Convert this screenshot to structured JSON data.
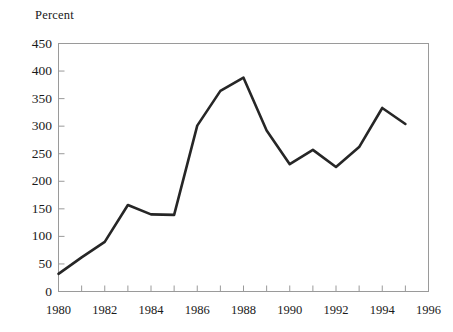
{
  "chart_data": {
    "type": "line",
    "title": "",
    "subtitle": "",
    "ylabel": "Percent",
    "xlabel": "",
    "x": [
      1980,
      1981,
      1982,
      1983,
      1984,
      1985,
      1986,
      1987,
      1988,
      1989,
      1990,
      1991,
      1992,
      1993,
      1994,
      1995
    ],
    "values": [
      32,
      62,
      90,
      157,
      140,
      139,
      301,
      364,
      388,
      292,
      231,
      257,
      226,
      262,
      333,
      304
    ],
    "series": [
      {
        "name": "Percent",
        "values": [
          32,
          62,
          90,
          157,
          140,
          139,
          301,
          364,
          388,
          292,
          231,
          257,
          226,
          262,
          333,
          304
        ]
      }
    ],
    "xlim": [
      1980,
      1996
    ],
    "ylim": [
      0,
      450
    ],
    "ytick_labels": [
      "0",
      "50",
      "100",
      "150",
      "200",
      "250",
      "300",
      "350",
      "400",
      "450"
    ],
    "ytick_values": [
      0,
      50,
      100,
      150,
      200,
      250,
      300,
      350,
      400,
      450
    ],
    "xtick_labels": [
      "1980",
      "1982",
      "1984",
      "1986",
      "1988",
      "1990",
      "1992",
      "1994",
      "1996"
    ],
    "xtick_values": [
      1980,
      1982,
      1984,
      1986,
      1988,
      1990,
      1992,
      1994,
      1996
    ],
    "xminor_values": [
      1981,
      1983,
      1985,
      1987,
      1989,
      1991,
      1993,
      1995
    ],
    "grid": false,
    "legend": "none",
    "line_color": "#262626",
    "frame_color": "#9a9a9a",
    "background_color": "#ffffff"
  }
}
